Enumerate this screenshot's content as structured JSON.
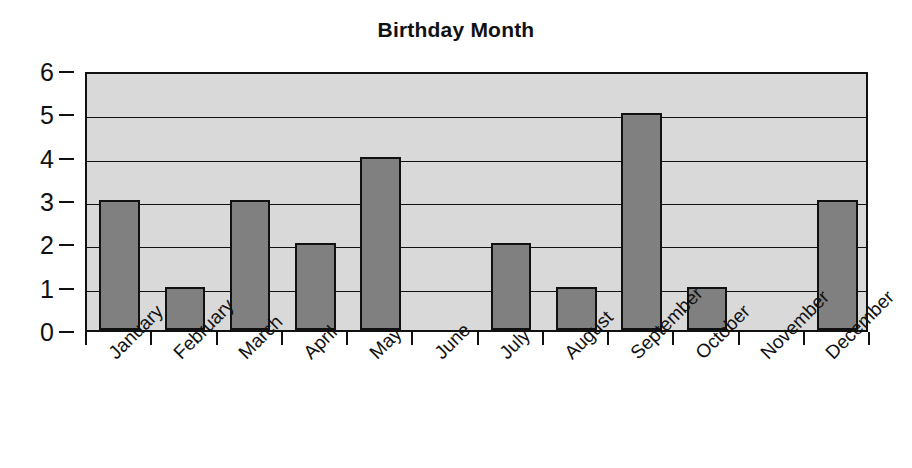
{
  "chart_data": {
    "type": "bar",
    "title": "Birthday Month",
    "xlabel": "",
    "ylabel": "",
    "categories": [
      "January",
      "February",
      "March",
      "April",
      "May",
      "June",
      "July",
      "August",
      "September",
      "October",
      "November",
      "December"
    ],
    "values": [
      3,
      1,
      3,
      2,
      4,
      0,
      2,
      1,
      5,
      1,
      0,
      3
    ],
    "ylim": [
      0,
      6
    ],
    "yticks": [
      0,
      1,
      2,
      3,
      4,
      5,
      6
    ],
    "ytick_labels": [
      "0",
      "1",
      "2",
      "3",
      "4",
      "5",
      "6"
    ],
    "grid": true,
    "grid_axis": "y",
    "legend": false,
    "legend_position": "none",
    "xtick_label_rotation": -45,
    "colors": {
      "bar_fill": "#808080",
      "bar_edge": "#111111",
      "plot_background": "#d9d9d9",
      "figure_background": "#ffffff",
      "axis": "#111111",
      "gridline": "#111111",
      "text": "#111111"
    }
  }
}
